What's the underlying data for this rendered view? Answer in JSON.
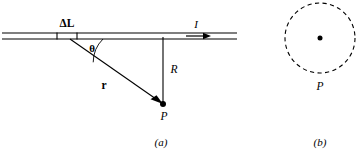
{
  "figure": {
    "colors": {
      "ink": "#000000",
      "background": "#ffffff"
    },
    "panels": [
      {
        "id": "a",
        "caption": "(a)",
        "caption_x": 161,
        "caption_y": 143,
        "description": "Straight current-carrying wire with element Delta L, field point P"
      },
      {
        "id": "b",
        "caption": "(b)",
        "caption_x": 320,
        "caption_y": 143,
        "description": "End-on view: dashed circular field line around wire through point P"
      }
    ],
    "panel_a": {
      "wire": {
        "name": "current-carrying-wire",
        "x_start": 2,
        "x_end": 237,
        "y_top": 33,
        "y_bottom": 39
      },
      "segment": {
        "label": "ΔL",
        "label_x": 67,
        "label_y": 24,
        "tick_left_x": 57,
        "tick_right_x": 77
      },
      "current": {
        "label": "I",
        "label_x": 196,
        "label_y": 25,
        "arrow_x_start": 186,
        "arrow_x_end": 207,
        "arrow_y": 36
      },
      "angle": {
        "label": "θ",
        "label_x": 92,
        "label_y": 49,
        "vertex_x": 70,
        "vertex_y": 39,
        "arc_radius": 33
      },
      "r_vector": {
        "label": "r",
        "label_x": 104,
        "label_y": 86,
        "x1": 70,
        "y1": 39,
        "x2": 160,
        "y2": 102
      },
      "R_distance": {
        "label": "R",
        "label_x": 174,
        "label_y": 70,
        "x": 163,
        "y_top": 38,
        "y_bottom": 104
      },
      "point_P": {
        "label": "P",
        "dot_x": 163,
        "dot_y": 104,
        "dot_radius": 3,
        "label_x": 164,
        "label_y": 117
      }
    },
    "panel_b": {
      "field_circle": {
        "name": "magnetic-field-line",
        "center_x": 320,
        "center_y": 38,
        "radius": 35,
        "style": "dashed"
      },
      "wire_dot": {
        "name": "wire-cross-section",
        "x": 320,
        "y": 38,
        "radius": 2.5
      },
      "point_P": {
        "label": "P",
        "label_x": 320,
        "label_y": 87
      }
    }
  }
}
